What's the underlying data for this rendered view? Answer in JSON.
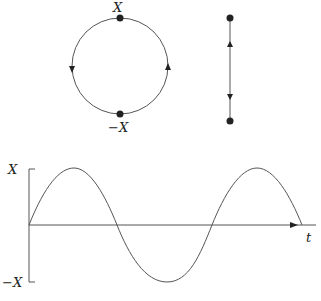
{
  "phase_circle": {
    "top_label": "X",
    "bottom_label": "−X",
    "direction": "counterclockwise"
  },
  "line_motion": {
    "description": "oscillation along a line between two endpoints"
  },
  "waveform": {
    "y_top_label": "X",
    "y_bottom_label": "−X",
    "x_label": "t"
  },
  "colors": {
    "stroke": "#555555",
    "dot": "#222222"
  }
}
